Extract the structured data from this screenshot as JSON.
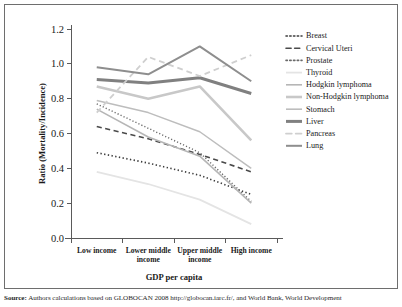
{
  "chart_data": {
    "type": "line",
    "title": "",
    "xlabel": "GDP per capita",
    "ylabel": "Ratio (Mortality/Incidence)",
    "categories": [
      "Low income",
      "Lower middle income",
      "Upper middle income",
      "High income"
    ],
    "ylim": [
      0.0,
      1.2
    ],
    "yticks": [
      "0.0",
      "0.2",
      "0.4",
      "0.6",
      "0.8",
      "1.0",
      "1.2"
    ],
    "ytick_values": [
      0.0,
      0.2,
      0.4,
      0.6,
      0.8,
      1.0,
      1.2
    ],
    "grid": false,
    "legend_position": "right",
    "series": [
      {
        "name": "Breast",
        "values": [
          0.49,
          0.43,
          0.36,
          0.25
        ],
        "style": "dotted",
        "color": "#3c3c3c",
        "width": 1.6
      },
      {
        "name": "Cervical Uteri",
        "values": [
          0.64,
          0.57,
          0.48,
          0.38
        ],
        "style": "dashed",
        "color": "#4a4a4a",
        "width": 1.6
      },
      {
        "name": "Prostate",
        "values": [
          0.77,
          0.63,
          0.49,
          0.21
        ],
        "style": "dotted",
        "color": "#6a6a6a",
        "width": 1.4
      },
      {
        "name": "Thyroid",
        "values": [
          0.38,
          0.31,
          0.22,
          0.08
        ],
        "style": "solid",
        "color": "#e4e4e4",
        "width": 1.8
      },
      {
        "name": "Hodgkin lymphoma",
        "values": [
          0.74,
          0.58,
          0.47,
          0.2
        ],
        "style": "solid",
        "color": "#b6b6b6",
        "width": 1.6
      },
      {
        "name": "Non-Hodgkin lymphoma",
        "values": [
          0.87,
          0.8,
          0.87,
          0.56
        ],
        "style": "solid",
        "color": "#c8c8c8",
        "width": 2.6
      },
      {
        "name": "Stomach",
        "values": [
          0.79,
          0.72,
          0.61,
          0.4
        ],
        "style": "solid",
        "color": "#bdbdbd",
        "width": 1.5
      },
      {
        "name": "Liver",
        "values": [
          0.91,
          0.89,
          0.92,
          0.83
        ],
        "style": "solid",
        "color": "#808080",
        "width": 3.0
      },
      {
        "name": "Pancreas",
        "values": [
          0.72,
          1.04,
          0.93,
          1.05
        ],
        "style": "dashed",
        "color": "#cfcfcf",
        "width": 1.8
      },
      {
        "name": "Lung",
        "values": [
          0.98,
          0.94,
          1.1,
          0.9
        ],
        "style": "solid",
        "color": "#8e8e8e",
        "width": 2.0
      }
    ]
  },
  "legend": {
    "entries": [
      "Breast",
      "Cervical Uteri",
      "Prostate",
      "Thyroid",
      "Hodgkin lymphoma",
      "Non-Hodgkin lymphoma",
      "Stomach",
      "Liver",
      "Pancreas",
      "Lung"
    ]
  },
  "source": {
    "label": "Source:",
    "text": "Authors calculations based on GLOBOCAN 2008 http://globocan.iarc.fr/, and World Bank, World Development"
  }
}
